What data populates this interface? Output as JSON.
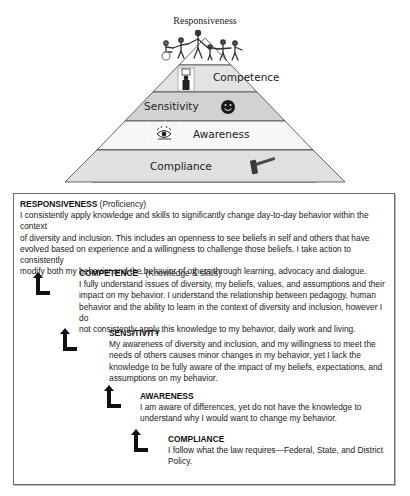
{
  "pyramid": {
    "top_label": "Responsiveness",
    "levels": [
      {
        "label": "Competence",
        "icon": "person-at-desk-icon",
        "fill": "#e3e3e3"
      },
      {
        "label": "Sensitivity",
        "icon": "smiley-face-icon",
        "fill": "#d2d2d2"
      },
      {
        "label": "Awareness",
        "icon": "eye-icon",
        "fill": "#f7f7f7"
      },
      {
        "label": "Compliance",
        "icon": "gavel-icon",
        "fill": "#e0e0e0"
      }
    ],
    "top_icon": "people-holding-hands-icon"
  },
  "levels": {
    "responsiveness": {
      "title": "RESPONSIVENESS",
      "subtitle": " (Proficiency)",
      "lines": [
        "I consistently apply knowledge and skills to significantly change day-to-day behavior within the context",
        "of diversity and inclusion. This includes an openness to see beliefs in self and others that have",
        "evolved based on experience and a willingness to challenge those beliefs. I take action to consistently",
        "modify both my behavior and the behavior of others through learning, advocacy and dialogue."
      ]
    },
    "competence": {
      "title": "COMPETENCE",
      "subtitle": " - (Knowledge & skills)",
      "lines": [
        "I fully understand issues of diversity, my beliefs, values, and assumptions and their",
        "impact on my behavior. I understand the relationship between pedagogy, human",
        "behavior and the ability to learn in the context of diversity and inclusion, however I do",
        "not consistently apply this knowledge to my behavior, daily work and living."
      ]
    },
    "sensitivity": {
      "title": "SENSITIVITY",
      "subtitle": "",
      "lines": [
        "My awareness of diversity and inclusion, and my willingness to meet the",
        "needs of others causes minor changes in my behavior, yet I lack the",
        "knowledge to be fully aware of the impact of my beliefs, expectations, and",
        "assumptions on my behavior."
      ]
    },
    "awareness": {
      "title": "AWARENESS",
      "subtitle": "",
      "lines": [
        "I am aware of differences, yet do not have the knowledge to",
        "understand why I would want to change my behavior."
      ]
    },
    "compliance": {
      "title": "COMPLIANCE",
      "subtitle": "",
      "lines": [
        "I follow what the law requires—Federal, State, and District",
        "Policy."
      ]
    }
  }
}
